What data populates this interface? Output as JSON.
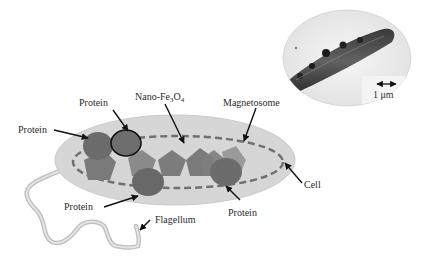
{
  "figure": {
    "colors": {
      "cell_fill": "#d6d6d6",
      "cell_stroke": "#c4c4c4",
      "magnetosome_dash": "#6e6e6e",
      "protein_fill": "#6b6b6b",
      "nanoparticle_fill": "#7c7c7c",
      "nanoparticle_light": "#9a9a9a",
      "flagellum": "#cfcfcf",
      "arrow": "#111111",
      "text": "#2a2a2a"
    }
  },
  "labels": {
    "protein_top": "Protein",
    "protein_left": "Protein",
    "nano_prefix": "Nano-Fe",
    "nano_sub1": "3",
    "nano_mid": "O",
    "nano_sub2": "4",
    "magnetosome": "Magnetosome",
    "cell": "Cell",
    "protein_bottom_left": "Protein",
    "protein_bottom_right": "Protein",
    "flagellum": "Flagellum"
  },
  "micrograph": {
    "scale_bar_label": "1 μm",
    "description": "TEM image of bacterium with magnetosome chain"
  }
}
